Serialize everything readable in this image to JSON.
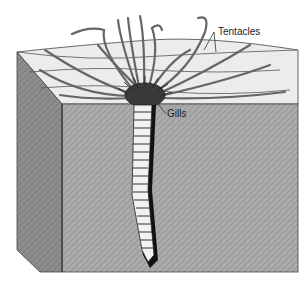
{
  "diagram": {
    "labels": {
      "tentacles": "Tentacles",
      "gills": "Gills"
    },
    "colors": {
      "background": "#ffffff",
      "sediment_front": "#a9a9a9",
      "sediment_side": "#8f8f8f",
      "surface": "#eeeeee",
      "outline": "#333333",
      "worm_body": "#f2f2f2",
      "worm_shadow": "#111111"
    }
  }
}
